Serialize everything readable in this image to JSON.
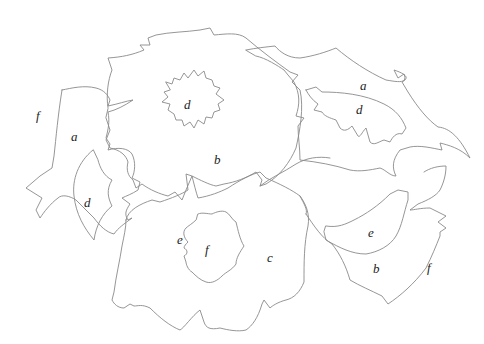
{
  "diagram": {
    "type": "labeled-region line drawing",
    "line_color": "#8a8a8a",
    "label_color": "#222222",
    "background": "#ffffff",
    "labels": [
      {
        "id": "left-outside",
        "text": "f",
        "x": 36,
        "y": 120
      },
      {
        "id": "left-leaf-a",
        "text": "a",
        "x": 75,
        "y": 141
      },
      {
        "id": "left-leaf-inner-d",
        "text": "d",
        "x": 88,
        "y": 207
      },
      {
        "id": "top-flower-center",
        "text": "d",
        "x": 188,
        "y": 109
      },
      {
        "id": "top-flower-petals",
        "text": "b",
        "x": 218,
        "y": 164
      },
      {
        "id": "right-leaf-a",
        "text": "a",
        "x": 364,
        "y": 90
      },
      {
        "id": "right-leaf-inner-d",
        "text": "d",
        "x": 360,
        "y": 114
      },
      {
        "id": "bottom-flower-ring",
        "text": "e",
        "x": 181,
        "y": 244
      },
      {
        "id": "bottom-flower-center",
        "text": "f",
        "x": 209,
        "y": 254
      },
      {
        "id": "bottom-flower-petals",
        "text": "c",
        "x": 271,
        "y": 262
      },
      {
        "id": "right-leaf-inner-e",
        "text": "e",
        "x": 372,
        "y": 237
      },
      {
        "id": "right-leaf-b",
        "text": "b",
        "x": 377,
        "y": 273
      },
      {
        "id": "right-outside",
        "text": "f",
        "x": 430,
        "y": 272
      }
    ]
  }
}
